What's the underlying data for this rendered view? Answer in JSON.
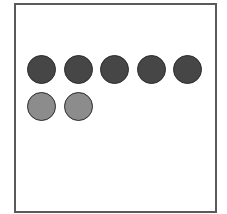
{
  "figure": {
    "frame": {
      "border_color": "#5a5a5a",
      "background": "#ffffff"
    },
    "rows": [
      {
        "name": "dark-row",
        "count": 5,
        "fill": "#464646",
        "stroke": "#2a2a2a"
      },
      {
        "name": "light-row",
        "count": 2,
        "fill": "#8c8c8c",
        "stroke": "#2a2a2a"
      }
    ],
    "total_circles": 7
  }
}
